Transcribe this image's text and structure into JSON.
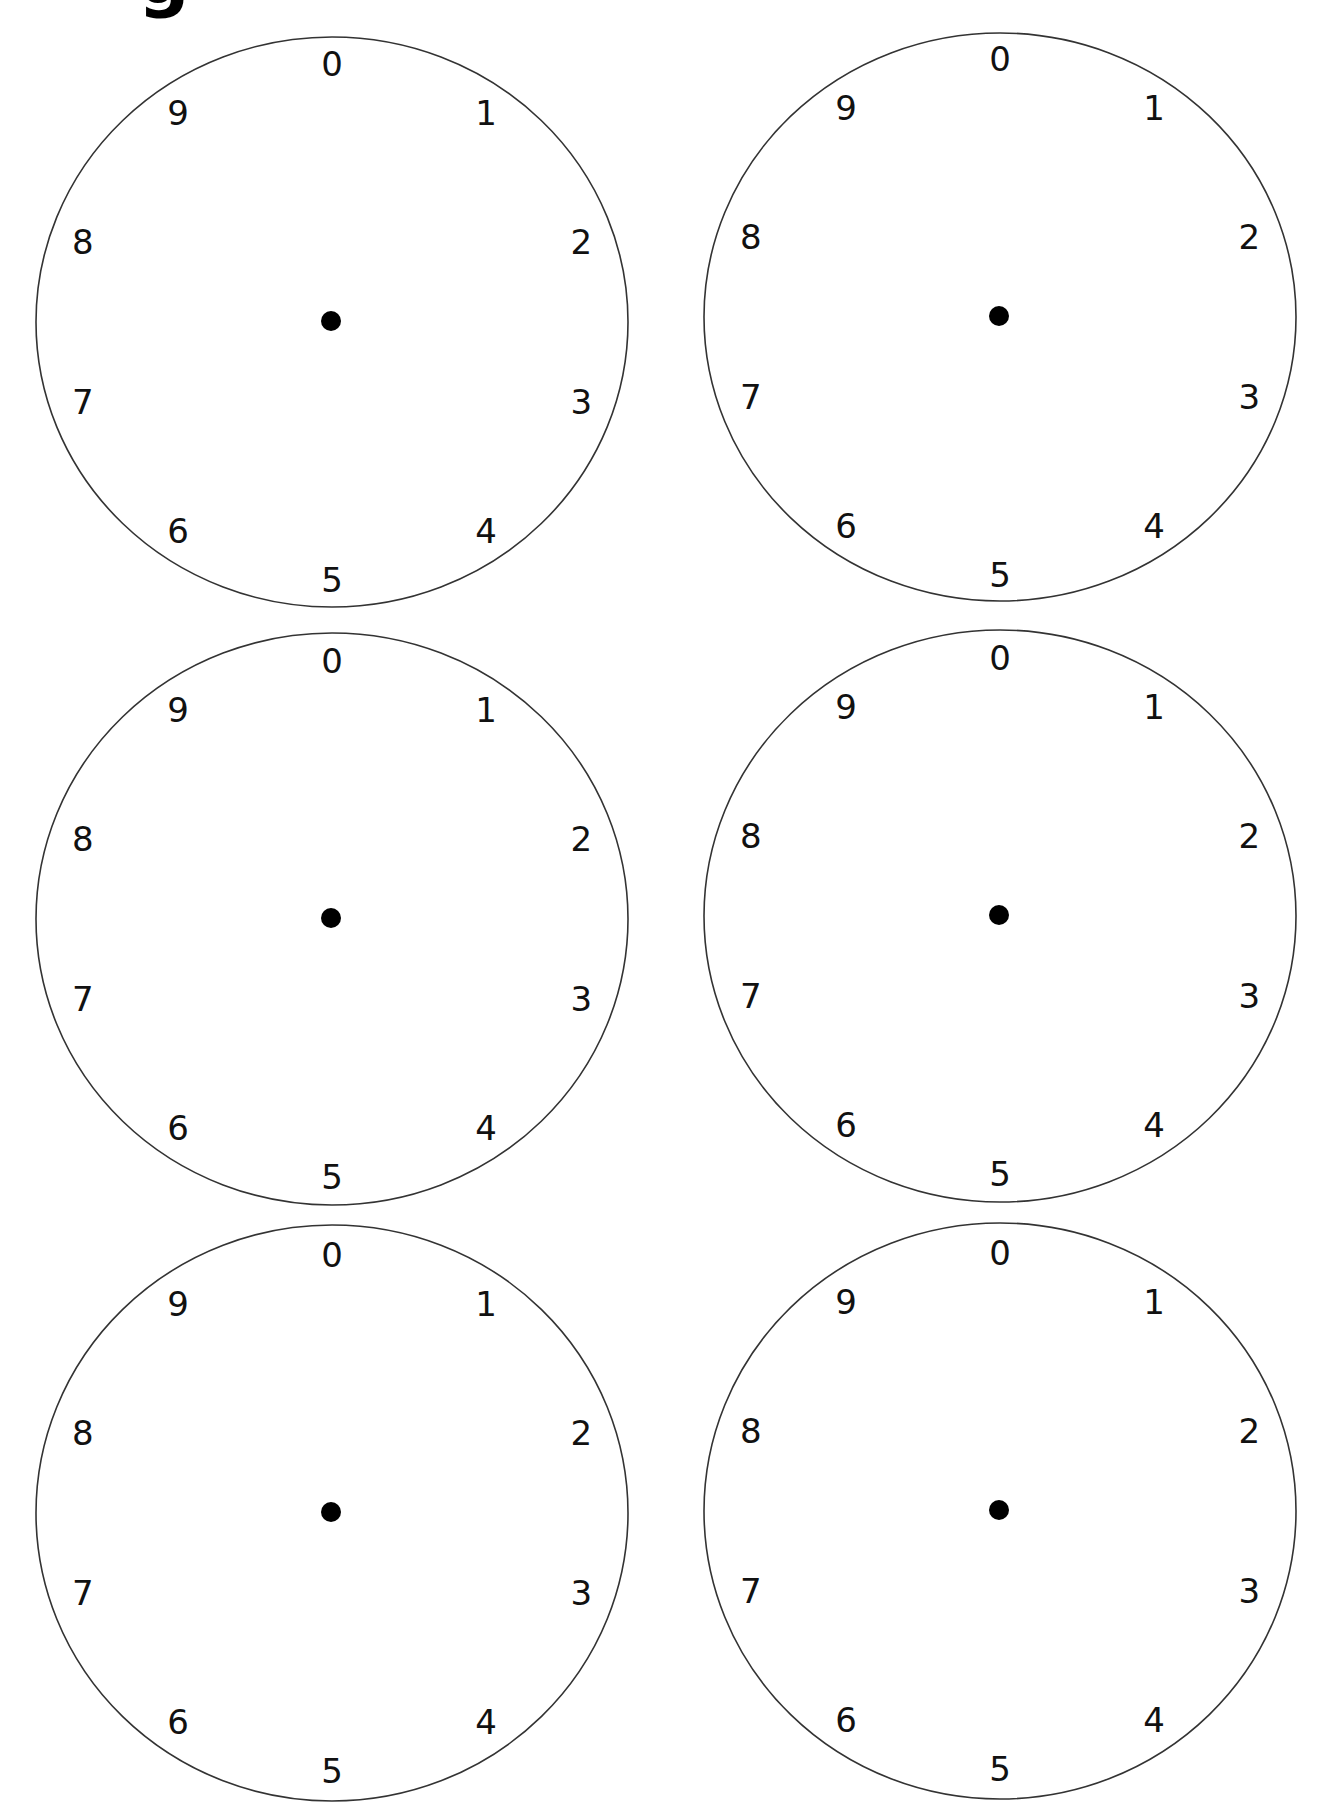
{
  "page": {
    "title_fragment": "g",
    "background": "#ffffff",
    "ink_color": "#111111",
    "stroke_color": "#333333"
  },
  "dial_labels": [
    "0",
    "1",
    "2",
    "3",
    "4",
    "5",
    "6",
    "7",
    "8",
    "9"
  ],
  "dials": [
    {
      "name": "dial-row1-left",
      "cx": 332,
      "cy": 322,
      "rx": 296,
      "ry": 285
    },
    {
      "name": "dial-row1-right",
      "cx": 1000,
      "cy": 317,
      "rx": 296,
      "ry": 284
    },
    {
      "name": "dial-row2-left",
      "cx": 332,
      "cy": 919,
      "rx": 296,
      "ry": 286
    },
    {
      "name": "dial-row2-right",
      "cx": 1000,
      "cy": 916,
      "rx": 296,
      "ry": 286
    },
    {
      "name": "dial-row3-left",
      "cx": 332,
      "cy": 1513,
      "rx": 296,
      "ry": 288
    },
    {
      "name": "dial-row3-right",
      "cx": 1000,
      "cy": 1511,
      "rx": 296,
      "ry": 288
    }
  ],
  "dial_style": {
    "label_rx": 262,
    "label_ry": 258,
    "center_dot_radius": 10,
    "stroke_width": 1.6
  }
}
